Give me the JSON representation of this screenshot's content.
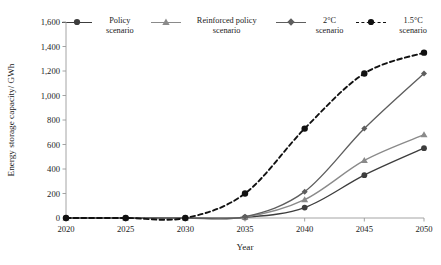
{
  "chart_data": {
    "type": "line",
    "title": "",
    "xlabel": "Year",
    "ylabel": "Energy storage capacity/ GWh",
    "x": [
      2020,
      2025,
      2030,
      2035,
      2040,
      2045,
      2050
    ],
    "xtick_labels": [
      "2020",
      "2025",
      "2030",
      "2035",
      "2040",
      "2045",
      "2050"
    ],
    "ytick_labels": [
      "0",
      "200",
      "400",
      "600",
      "800",
      "1,000",
      "1,200",
      "1,400",
      "1,600"
    ],
    "yticks": [
      0,
      200,
      400,
      600,
      800,
      1000,
      1200,
      1400,
      1600
    ],
    "ylim": [
      0,
      1600
    ],
    "xlim": [
      2020,
      2050
    ],
    "grid": false,
    "legend_position": "top",
    "series": [
      {
        "name": "Policy scenario",
        "values": [
          0,
          0,
          0,
          5,
          85,
          350,
          570
        ],
        "color": "#3d3d3d",
        "marker": "circle",
        "linestyle": "solid"
      },
      {
        "name": "Reinforced policy scenario",
        "values": [
          0,
          0,
          0,
          8,
          150,
          470,
          680
        ],
        "color": "#8a8a8a",
        "marker": "triangle",
        "linestyle": "solid"
      },
      {
        "name": "2°C scenario",
        "values": [
          0,
          0,
          0,
          10,
          215,
          730,
          1180
        ],
        "color": "#5e5e5e",
        "marker": "diamond",
        "linestyle": "solid"
      },
      {
        "name": "1.5°C scenario",
        "values": [
          0,
          0,
          0,
          200,
          730,
          1180,
          1350
        ],
        "color": "#111111",
        "marker": "circle",
        "linestyle": "dashed"
      }
    ]
  }
}
